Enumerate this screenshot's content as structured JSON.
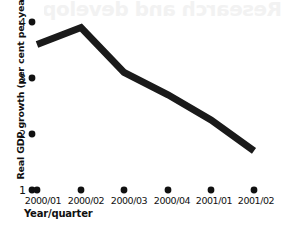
{
  "ghost": {
    "overlay_text": "Research and development"
  },
  "chart_data": {
    "type": "line",
    "title": "",
    "xlabel": "Year/quarter",
    "ylabel": "Real GDP growth (per cent per year)",
    "categories": [
      "2000/01",
      "2000/02",
      "2000/03",
      "2000/04",
      "2001/01",
      "2001/02"
    ],
    "values": [
      3.6,
      3.9,
      3.1,
      2.7,
      2.25,
      1.7
    ],
    "series": [
      {
        "name": "Real GDP growth",
        "values": [
          3.6,
          3.9,
          3.1,
          2.7,
          2.25,
          1.7
        ]
      }
    ],
    "ylim": [
      1,
      4
    ],
    "yticks": [
      1,
      2,
      3,
      4
    ],
    "ytick_labels": [
      "1",
      "2",
      "3",
      "4"
    ],
    "grid": false,
    "legend": false,
    "line_color": "#1a1a1a",
    "line_width": 7,
    "marker": "dot",
    "marker_color": "#111111"
  }
}
